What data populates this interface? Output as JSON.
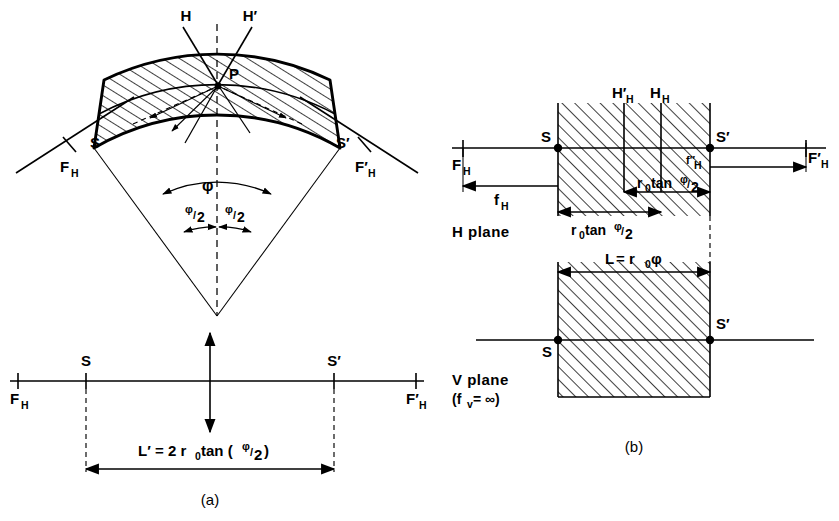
{
  "figure": {
    "caption_a": "(a)",
    "caption_b": "(b)"
  },
  "panel_a": {
    "sector": {
      "ray_h_label": "H",
      "ray_h_prime_label": "H′",
      "point_p_label": "P",
      "s_label": "S",
      "s_prime_label": "S′",
      "focal_left": "F",
      "focal_left_sub": "H",
      "focal_right": "F′",
      "focal_right_sub": "H",
      "angle_phi": "φ",
      "angle_half_left_num": "φ",
      "angle_half_left_den": "2",
      "angle_half_right_num": "φ",
      "angle_half_right_den": "2"
    },
    "axis": {
      "s_label": "S",
      "s_prime_label": "S′",
      "focal_left": "F",
      "focal_left_sub": "H",
      "focal_right": "F′",
      "focal_right_sub": "H",
      "dimension_formula": "L′ = 2 r₀ tan (φ/2)",
      "dim_L": "L′",
      "dim_eq": "= 2 r",
      "dim_r_sub": "0",
      "dim_tan": "tan (",
      "dim_phi": "φ",
      "dim_slash": "/",
      "dim_two": "2",
      "dim_close": ")"
    }
  },
  "panel_b": {
    "h_plane": {
      "title": "H plane",
      "s_label": "S",
      "s_prime_label": "S′",
      "focal_left": "F",
      "focal_left_sub": "H",
      "focal_right": "F′",
      "focal_right_sub": "H",
      "principal_plane_left": "H′",
      "principal_plane_left_sub": "H",
      "principal_plane_right": "H",
      "principal_plane_right_sub": "H",
      "focal_dist_left": "f",
      "focal_dist_left_sub": "H",
      "focal_dist_right": "f″",
      "focal_dist_right_sub": "H",
      "dim_left": "r₀ tan φ/2",
      "dim_left_r": "r",
      "dim_left_r_sub": "0",
      "dim_left_tan": "tan",
      "dim_left_phi": "φ",
      "dim_left_den": "2",
      "dim_right": "r₀ tan φ/2",
      "dim_right_r": "r",
      "dim_right_r_sub": "0",
      "dim_right_tan": "tan",
      "dim_right_phi": "φ",
      "dim_right_den": "2"
    },
    "v_plane": {
      "title": "V plane",
      "subtitle": "(fᵥ = ∞)",
      "subtitle_open": "(f",
      "subtitle_sub": "v",
      "subtitle_rest": "= ∞)",
      "s_label": "S",
      "s_prime_label": "S′",
      "dim_label": "L = r₀φ",
      "dim_L": "L",
      "dim_eq": "= r",
      "dim_r_sub": "0",
      "dim_phi": "φ"
    }
  },
  "colors": {
    "ink": "#000000",
    "paper": "#ffffff"
  }
}
